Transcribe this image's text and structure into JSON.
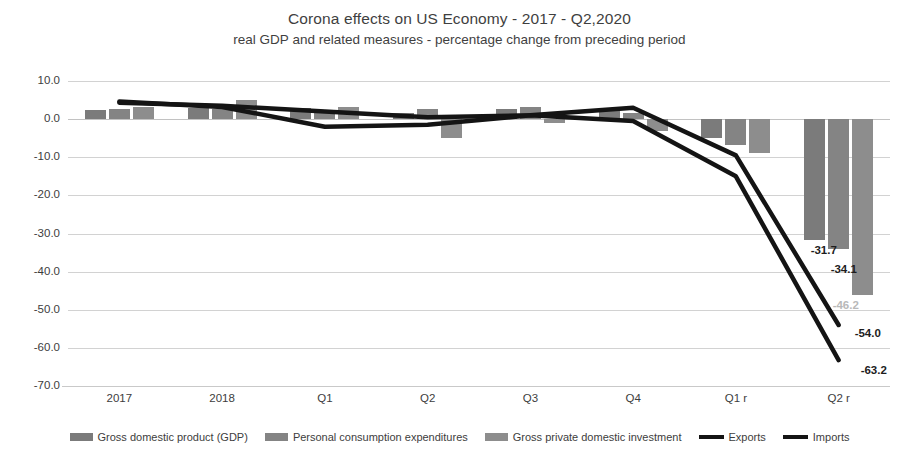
{
  "chart_data": {
    "type": "bar",
    "title": "Corona effects on US Economy - 2017 - Q2,2020",
    "subtitle": "real GDP and related measures - percentage change from preceding period",
    "xlabel": "",
    "ylabel": "",
    "ylim": [
      -70.0,
      10.0
    ],
    "ytick_step": 10.0,
    "ytick_labels": [
      "10.0",
      "0.0",
      "-10.0",
      "-20.0",
      "-30.0",
      "-40.0",
      "-50.0",
      "-60.0",
      "-70.0"
    ],
    "ytick_values": [
      10.0,
      0.0,
      -10.0,
      -20.0,
      -30.0,
      -40.0,
      -50.0,
      -60.0,
      -70.0
    ],
    "grid": true,
    "legend_position": "bottom",
    "categories": [
      "2017",
      "2018",
      "Q1",
      "Q2",
      "Q3",
      "Q4",
      "Q1 r",
      "Q2 r"
    ],
    "series": [
      {
        "name": "Gross domestic product (GDP)",
        "kind": "bar",
        "color": "#7b7b7b",
        "values": [
          2.4,
          2.9,
          2.9,
          1.5,
          2.6,
          2.4,
          -5.0,
          -31.7
        ]
      },
      {
        "name": "Personal consumption expenditures",
        "kind": "bar",
        "color": "#848484",
        "values": [
          2.6,
          2.7,
          1.8,
          2.7,
          3.2,
          1.6,
          -6.9,
          -34.1
        ]
      },
      {
        "name": "Gross private domestic investment",
        "kind": "bar",
        "color": "#8d8d8d",
        "values": [
          3.2,
          5.0,
          3.2,
          -5.0,
          -1.0,
          -3.0,
          -9.0,
          -46.2
        ]
      },
      {
        "name": "Exports",
        "kind": "line",
        "color": "#141414",
        "values": [
          4.3,
          3.5,
          2.0,
          0.5,
          1.0,
          3.0,
          -9.5,
          -54.0
        ]
      },
      {
        "name": "Imports",
        "kind": "line",
        "color": "#141414",
        "values": [
          4.6,
          3.2,
          -2.0,
          -1.5,
          1.0,
          -0.5,
          -15.0,
          -63.2
        ]
      }
    ],
    "data_labels": [
      {
        "text": "-31.7",
        "series": "Gross domestic product (GDP)",
        "category": "Q2 r",
        "value": -31.7,
        "style": "dark"
      },
      {
        "text": "-34.1",
        "series": "Personal consumption expenditures",
        "category": "Q2 r",
        "value": -34.1,
        "style": "dark"
      },
      {
        "text": "-46.2",
        "series": "Gross private domestic investment",
        "category": "Q2 r",
        "value": -46.2,
        "style": "faint"
      },
      {
        "text": "-54.0",
        "series": "Exports",
        "category": "Q2 r",
        "value": -54.0,
        "style": "dark"
      },
      {
        "text": "-63.2",
        "series": "Imports",
        "category": "Q2 r",
        "value": -63.2,
        "style": "dark"
      }
    ]
  }
}
